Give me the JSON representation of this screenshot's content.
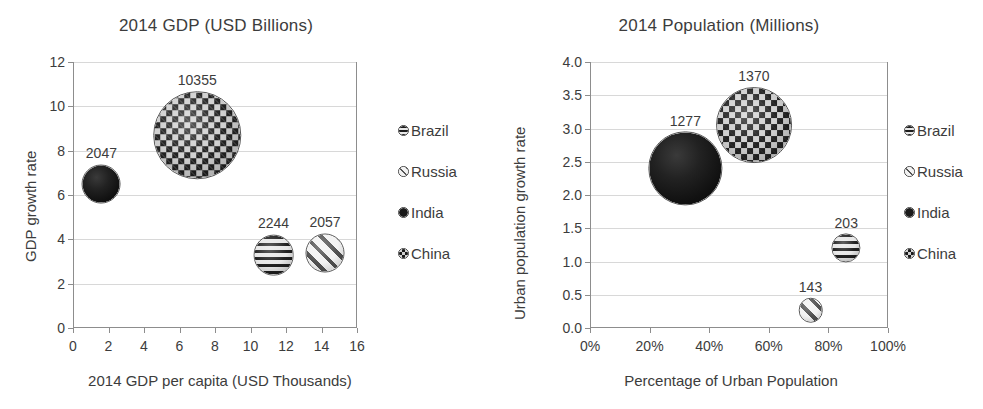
{
  "legend_series": [
    {
      "name": "Brazil",
      "pattern": "hstripe"
    },
    {
      "name": "Russia",
      "pattern": "dstripe"
    },
    {
      "name": "India",
      "pattern": "solid"
    },
    {
      "name": "China",
      "pattern": "check"
    }
  ],
  "colors": {
    "frame": "#8d8d8d",
    "gridline": "#d8d8d8",
    "text": "#3c3c3c",
    "background": "#ffffff"
  },
  "chart_data": [
    {
      "id": "gdp",
      "type": "scatter",
      "bubble": true,
      "title": "2014 GDP (USD Billions)",
      "xlabel": "2014 GDP per capita (USD Thousands)",
      "ylabel": "GDP growth rate",
      "xlim": [
        0,
        16
      ],
      "ylim": [
        0,
        12
      ],
      "xticks": [
        "0",
        "2",
        "4",
        "6",
        "8",
        "10",
        "12",
        "14",
        "16"
      ],
      "yticks": [
        "0",
        "2",
        "4",
        "6",
        "8",
        "10",
        "12"
      ],
      "grid": "horizontal",
      "legend_position": "right",
      "points": [
        {
          "name": "India",
          "x": 1.6,
          "y": 6.5,
          "size": 2047,
          "label": "2047",
          "pattern": "solid"
        },
        {
          "name": "China",
          "x": 7.0,
          "y": 8.7,
          "size": 10355,
          "label": "10355",
          "pattern": "check"
        },
        {
          "name": "Brazil",
          "x": 11.3,
          "y": 3.3,
          "size": 2244,
          "label": "2244",
          "pattern": "hstripe"
        },
        {
          "name": "Russia",
          "x": 14.2,
          "y": 3.4,
          "size": 2057,
          "label": "2057",
          "pattern": "dstripe"
        }
      ]
    },
    {
      "id": "population",
      "type": "scatter",
      "bubble": true,
      "title": "2014 Population (Millions)",
      "xlabel": "Percentage of Urban Population",
      "ylabel": "Urban population growth rate",
      "xlim": [
        0,
        100
      ],
      "ylim": [
        0,
        4.0
      ],
      "xticks": [
        "0%",
        "20%",
        "40%",
        "60%",
        "80%",
        "100%"
      ],
      "yticks": [
        "0.0",
        "0.5",
        "1.0",
        "1.5",
        "2.0",
        "2.5",
        "3.0",
        "3.5",
        "4.0"
      ],
      "grid": "horizontal",
      "legend_position": "right",
      "points": [
        {
          "name": "India",
          "x": 32,
          "y": 2.4,
          "size": 1277,
          "label": "1277",
          "pattern": "solid"
        },
        {
          "name": "China",
          "x": 55,
          "y": 3.05,
          "size": 1370,
          "label": "1370",
          "pattern": "check"
        },
        {
          "name": "Brazil",
          "x": 86,
          "y": 1.2,
          "size": 203,
          "label": "203",
          "pattern": "hstripe"
        },
        {
          "name": "Russia",
          "x": 74,
          "y": 0.27,
          "size": 143,
          "label": "143",
          "pattern": "dstripe"
        }
      ]
    }
  ]
}
